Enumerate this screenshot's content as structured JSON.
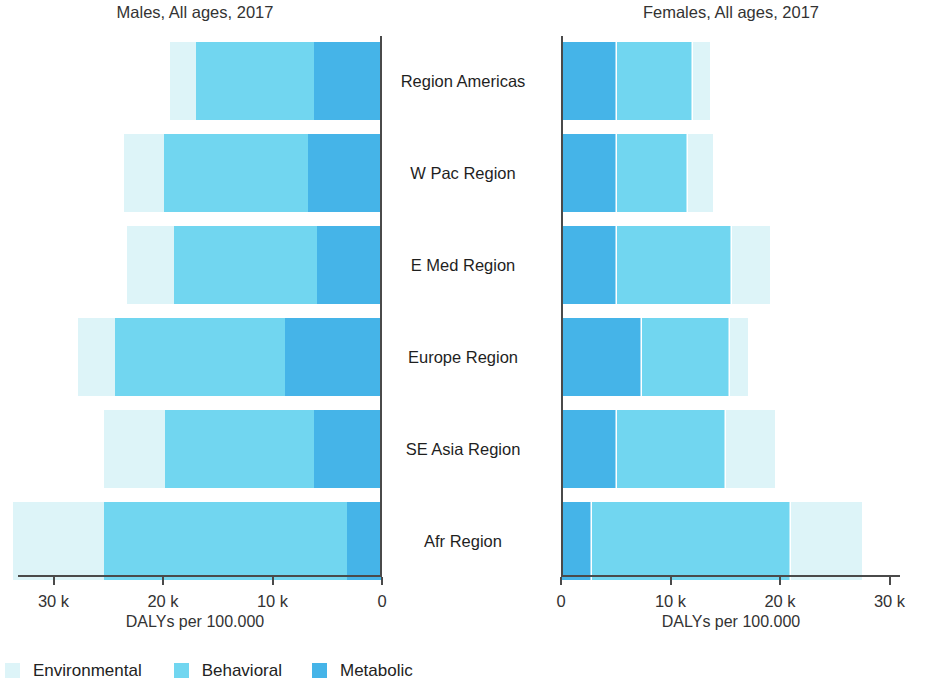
{
  "panels": {
    "male": {
      "title": "Males, All ages, 2017",
      "axis_caption": "DALYs per 100.000",
      "ticks": [
        "30 k",
        "20 k",
        "10 k",
        "0"
      ]
    },
    "female": {
      "title": "Females, All ages, 2017",
      "axis_caption": "DALYs per 100.000",
      "ticks": [
        "0",
        "10 k",
        "20 k",
        "30 k"
      ]
    }
  },
  "legend": {
    "items": [
      {
        "label": "Environmental",
        "color": "#ddf4f8",
        "swatch_name": "legend-swatch-environmental"
      },
      {
        "label": "Behavioral",
        "color": "#71d6f0",
        "swatch_name": "legend-swatch-behavioral"
      },
      {
        "label": "Metabolic",
        "color": "#45b4e8",
        "swatch_name": "legend-swatch-metabolic"
      }
    ]
  },
  "chart_data": {
    "type": "bar",
    "subtype": "diverging-stacked-horizontal",
    "xlabel": "DALYs per 100.000",
    "ylabel": "",
    "xlim": [
      0,
      34000
    ],
    "xticks": [
      0,
      10000,
      20000,
      30000
    ],
    "xtick_labels": [
      "0",
      "10 k",
      "20 k",
      "30 k"
    ],
    "grid": false,
    "legend_position": "bottom",
    "stack_order_from_axis": [
      "Metabolic",
      "Behavioral",
      "Environmental"
    ],
    "categories": [
      "Region Americas",
      "W Pac Region",
      "E Med Region",
      "Europe Region",
      "SE Asia Region",
      "Afr Region"
    ],
    "panels": [
      {
        "name": "Males, All ages, 2017",
        "direction": "left",
        "series": [
          {
            "name": "Environmental",
            "color": "#ddf4f8",
            "values": [
              2400,
              3700,
              4300,
              3400,
              5600,
              8300
            ]
          },
          {
            "name": "Behavioral",
            "color": "#71d6f0",
            "values": [
              10800,
              13100,
              13100,
              15500,
              13600,
              22200
            ]
          },
          {
            "name": "Metabolic",
            "color": "#45b4e8",
            "values": [
              6200,
              6800,
              5900,
              8900,
              6200,
              3200
            ]
          }
        ],
        "totals": [
          19400,
          23600,
          23300,
          27800,
          25400,
          33700
        ]
      },
      {
        "name": "Females, All ages, 2017",
        "direction": "right",
        "series": [
          {
            "name": "Metabolic",
            "color": "#45b4e8",
            "values": [
              5100,
              5100,
              5100,
              7400,
              5100,
              2800
            ]
          },
          {
            "name": "Behavioral",
            "color": "#71d6f0",
            "values": [
              7000,
              6500,
              10500,
              8000,
              10000,
              18200
            ]
          },
          {
            "name": "Environmental",
            "color": "#ddf4f8",
            "values": [
              1500,
              2300,
              3500,
              1700,
              4400,
              6500
            ]
          }
        ],
        "totals": [
          13600,
          13900,
          19100,
          17100,
          19500,
          27500
        ]
      }
    ]
  }
}
